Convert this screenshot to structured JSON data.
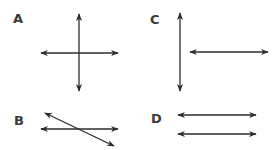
{
  "diagram": {
    "panels": [
      {
        "label": "A",
        "description": "perpendicular intersecting lines"
      },
      {
        "label": "B",
        "description": "intersecting lines (not perpendicular)"
      },
      {
        "label": "C",
        "description": "perpendicular lines that do not intersect"
      },
      {
        "label": "D",
        "description": "parallel lines"
      }
    ],
    "colors": {
      "line": "#2b2b2b",
      "label": "#3a3a3a",
      "background": "#ffffff"
    }
  }
}
